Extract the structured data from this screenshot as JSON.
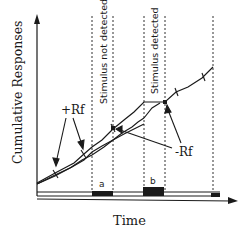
{
  "diagram": {
    "y_axis_label": "Cumulative  Responses",
    "x_axis_label": "Time",
    "regions": [
      {
        "label": "Stimulus not detected",
        "event": "a"
      },
      {
        "label": "Stimulus detected",
        "event": "b"
      }
    ],
    "annotations": {
      "positive_reinforcement": "+Rf",
      "negative_reinforcement": "-Rf"
    },
    "event_labels": {
      "a": "a",
      "b": "b"
    },
    "colors": {
      "ink": "#1a1a1a",
      "background": "#ffffff"
    }
  }
}
